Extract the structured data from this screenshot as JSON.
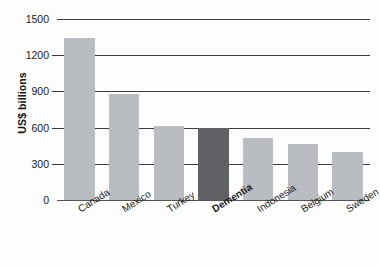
{
  "chart_data": {
    "type": "bar",
    "title": "",
    "subtitle": "",
    "xlabel": "",
    "ylabel": "US$ billions",
    "categories": [
      "Canada",
      "Mexico",
      "Turkey",
      "Dementia",
      "Indonesia",
      "Belgium",
      "Sweden"
    ],
    "values": [
      1340,
      875,
      615,
      600,
      515,
      465,
      400
    ],
    "highlight_category": "Dementia",
    "ylim": [
      0,
      1500
    ],
    "yticks": [
      0,
      300,
      600,
      900,
      1200,
      1500
    ],
    "ytick_labels": [
      "0",
      "300",
      "600",
      "900",
      "1200",
      "1500"
    ],
    "grid": true,
    "grid_axis": "y",
    "legend": false,
    "legend_position": "none",
    "bar_color": "#b9bdc1",
    "highlight_color": "#5f6164",
    "gridline_color": "#3a3a3a",
    "background_color": "#fdfdfd",
    "xlabel_rotation_degrees": -32
  }
}
